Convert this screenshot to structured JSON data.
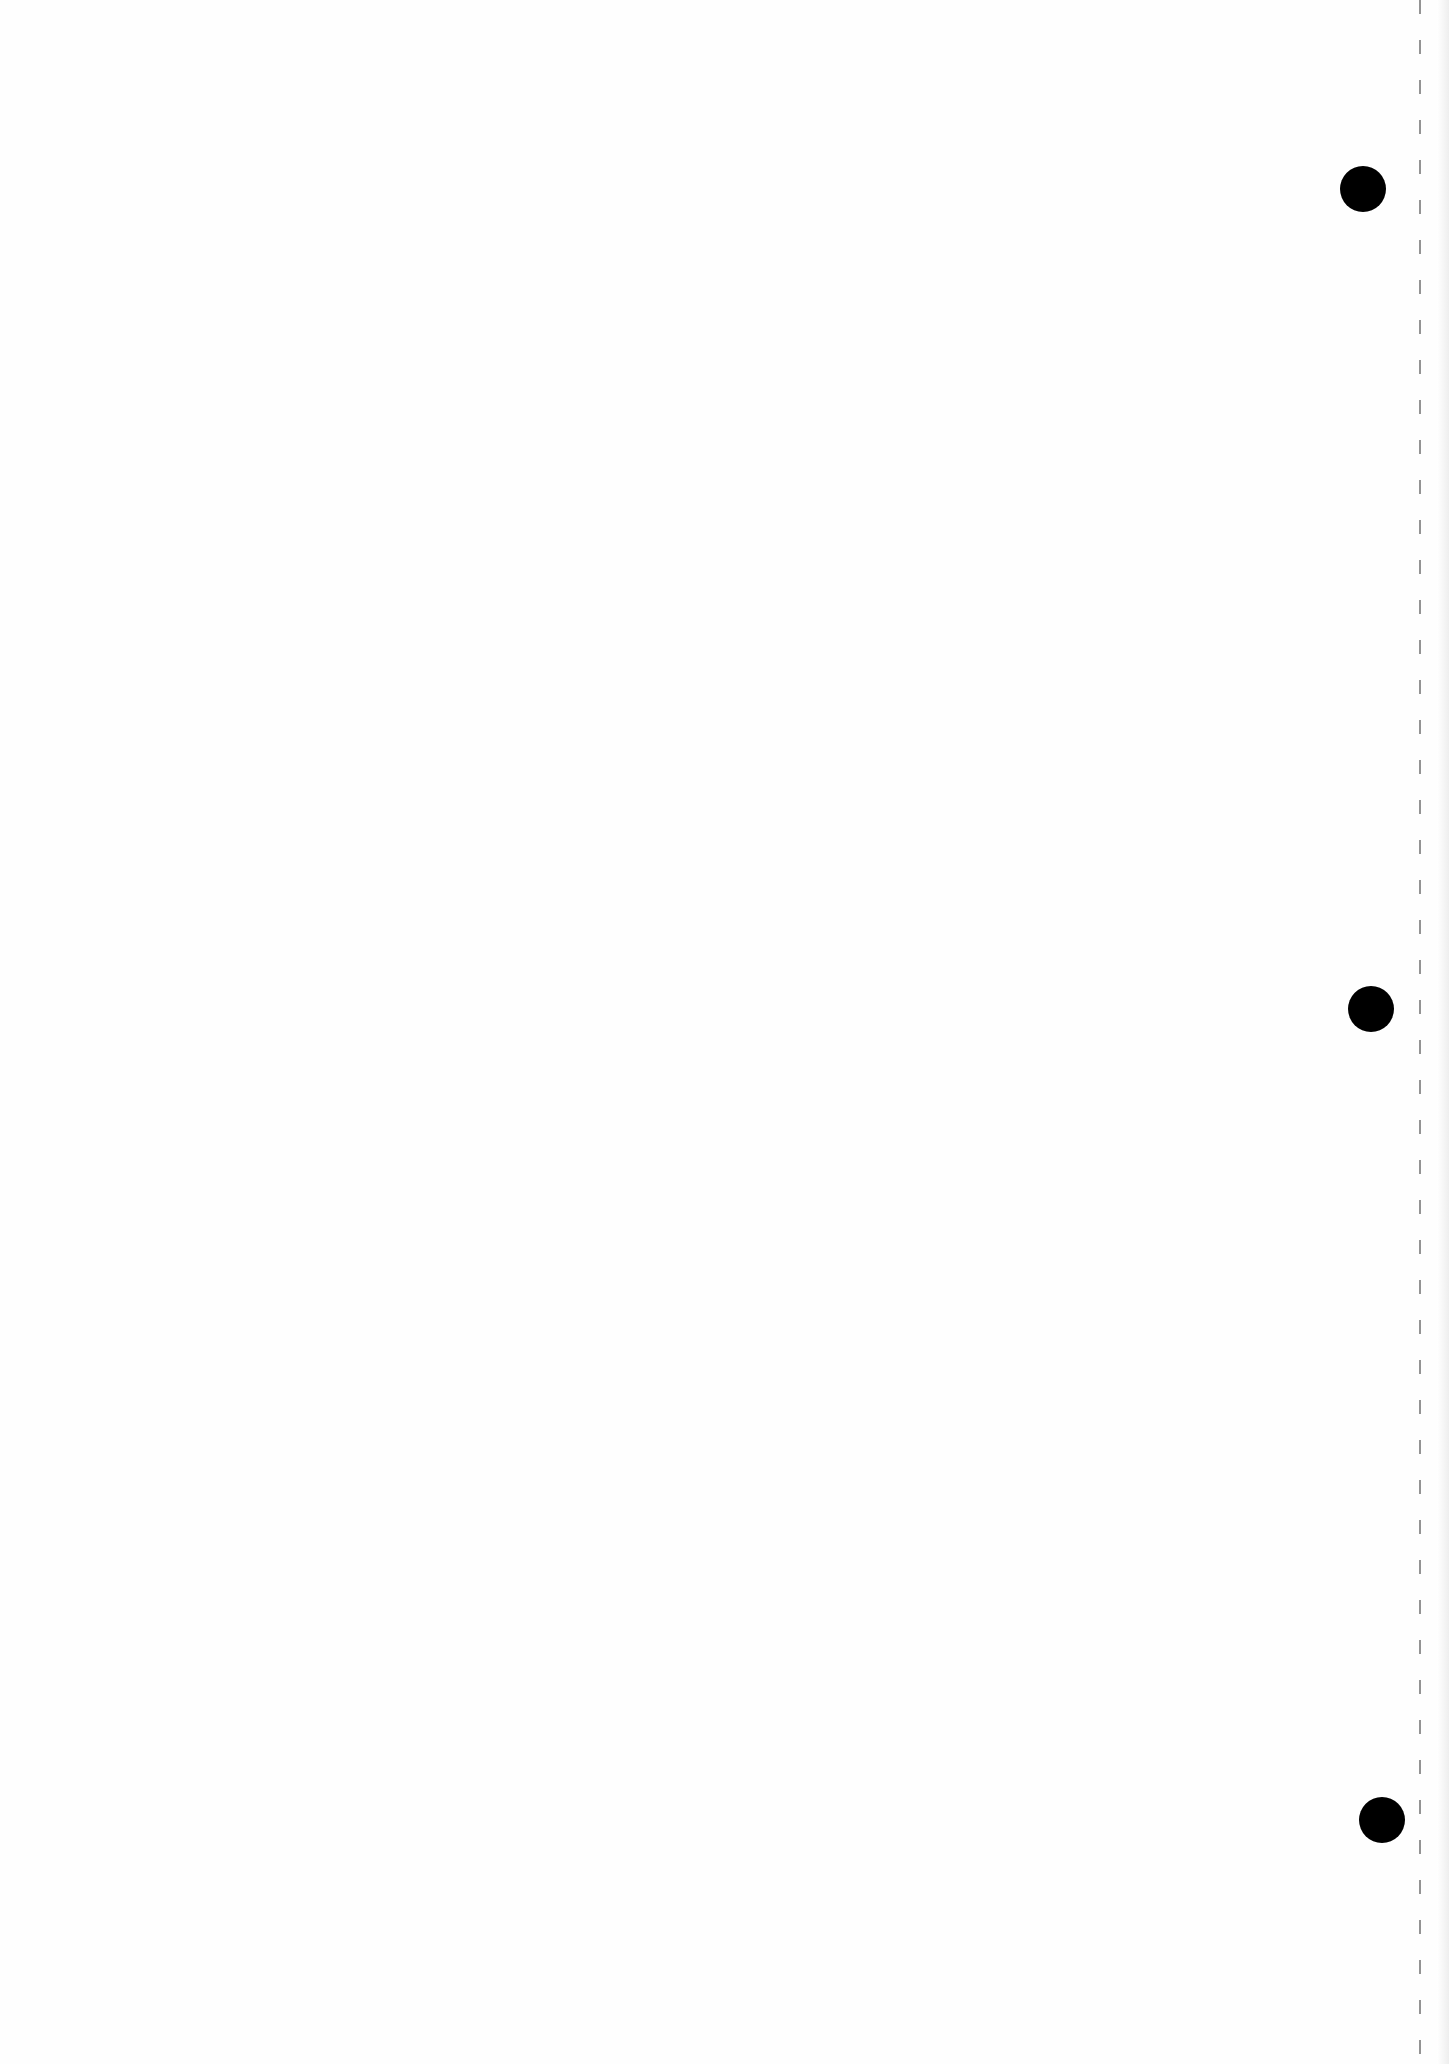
{
  "page": {
    "type": "blank-sheet",
    "content_text": "",
    "punch_holes": [
      {
        "x": 1363,
        "y": 189
      },
      {
        "x": 1371,
        "y": 1009
      },
      {
        "x": 1382,
        "y": 1820
      }
    ],
    "colors": {
      "paper": "#fefefe",
      "hole": "#000000",
      "tear_line": "#666666"
    }
  }
}
